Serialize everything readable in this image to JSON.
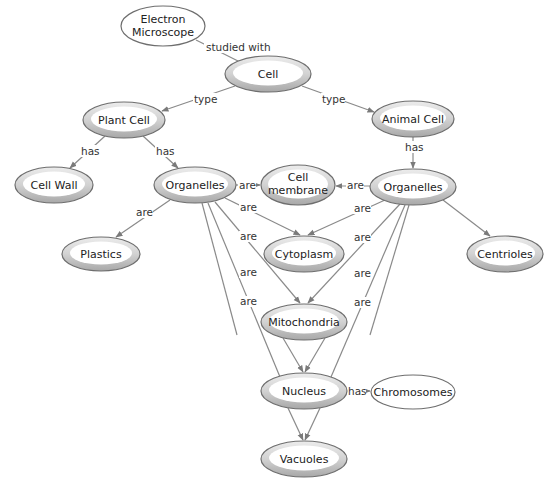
{
  "diagram": {
    "type": "concept-map",
    "nodes": [
      {
        "id": "electron_microscope",
        "label": [
          "Electron",
          "Microscope"
        ],
        "cx": 163,
        "cy": 26,
        "rx": 42,
        "ry": 20,
        "style": "plain"
      },
      {
        "id": "cell",
        "label": [
          "Cell"
        ],
        "cx": 268,
        "cy": 74,
        "rx": 43,
        "ry": 18,
        "style": "double"
      },
      {
        "id": "plant_cell",
        "label": [
          "Plant Cell"
        ],
        "cx": 124,
        "cy": 120,
        "rx": 41,
        "ry": 18,
        "style": "double"
      },
      {
        "id": "animal_cell",
        "label": [
          "Animal Cell"
        ],
        "cx": 413,
        "cy": 119,
        "rx": 41,
        "ry": 18,
        "style": "double"
      },
      {
        "id": "cell_wall",
        "label": [
          "Cell Wall"
        ],
        "cx": 54,
        "cy": 185,
        "rx": 39,
        "ry": 18,
        "style": "double"
      },
      {
        "id": "organelles_plant",
        "label": [
          "Organelles"
        ],
        "cx": 195,
        "cy": 185,
        "rx": 41,
        "ry": 18,
        "style": "double"
      },
      {
        "id": "cell_membrane",
        "label": [
          "Cell",
          "membrane"
        ],
        "cx": 298,
        "cy": 185,
        "rx": 37,
        "ry": 20,
        "style": "double"
      },
      {
        "id": "organelles_animal",
        "label": [
          "Organelles"
        ],
        "cx": 413,
        "cy": 187,
        "rx": 43,
        "ry": 18,
        "style": "double"
      },
      {
        "id": "plastics",
        "label": [
          "Plastics"
        ],
        "cx": 101,
        "cy": 254,
        "rx": 39,
        "ry": 17,
        "style": "double"
      },
      {
        "id": "cytoplasm",
        "label": [
          "Cytoplasm"
        ],
        "cx": 304,
        "cy": 254,
        "rx": 40,
        "ry": 18,
        "style": "double"
      },
      {
        "id": "centrioles",
        "label": [
          "Centrioles"
        ],
        "cx": 505,
        "cy": 254,
        "rx": 38,
        "ry": 18,
        "style": "double"
      },
      {
        "id": "mitochondria",
        "label": [
          "Mitochondria"
        ],
        "cx": 304,
        "cy": 322,
        "rx": 43,
        "ry": 18,
        "style": "double"
      },
      {
        "id": "nucleus",
        "label": [
          "Nucleus"
        ],
        "cx": 304,
        "cy": 391,
        "rx": 43,
        "ry": 18,
        "style": "double"
      },
      {
        "id": "chromosomes",
        "label": [
          "Chromosomes"
        ],
        "cx": 413,
        "cy": 392,
        "rx": 42,
        "ry": 17,
        "style": "plain"
      },
      {
        "id": "vacuoles",
        "label": [
          "Vacuoles"
        ],
        "cx": 304,
        "cy": 459,
        "rx": 43,
        "ry": 18,
        "style": "double"
      }
    ],
    "edges": [
      {
        "from": "electron_microscope",
        "to": "cell",
        "label": "studied with"
      },
      {
        "from": "cell",
        "to": "plant_cell",
        "label": "type"
      },
      {
        "from": "cell",
        "to": "animal_cell",
        "label": "type"
      },
      {
        "from": "plant_cell",
        "to": "cell_wall",
        "label": "has"
      },
      {
        "from": "plant_cell",
        "to": "organelles_plant",
        "label": "has"
      },
      {
        "from": "animal_cell",
        "to": "organelles_animal",
        "label": "has"
      },
      {
        "from": "organelles_plant",
        "to": "cell_membrane",
        "label": "are"
      },
      {
        "from": "organelles_animal",
        "to": "cell_membrane",
        "label": "are"
      },
      {
        "from": "organelles_plant",
        "to": "plastics",
        "label": "are"
      },
      {
        "from": "organelles_plant",
        "to": "cytoplasm",
        "label": "are"
      },
      {
        "from": "organelles_animal",
        "to": "cytoplasm",
        "label": "are"
      },
      {
        "from": "organelles_plant",
        "to": "mitochondria",
        "label": "are"
      },
      {
        "from": "organelles_animal",
        "to": "mitochondria",
        "label": "are"
      },
      {
        "from": "organelles_plant",
        "to": "nucleus",
        "label": "are"
      },
      {
        "from": "organelles_animal",
        "to": "nucleus",
        "label": "are"
      },
      {
        "from": "organelles_plant",
        "to": "vacuoles",
        "label": "are"
      },
      {
        "from": "organelles_animal",
        "to": "vacuoles",
        "label": "are"
      },
      {
        "from": "organelles_animal",
        "to": "centrioles",
        "label": ""
      },
      {
        "from": "nucleus",
        "to": "chromosomes",
        "label": "has"
      }
    ],
    "colors": {
      "line": "#8a8a8a",
      "oval_border": "#6e6e6e",
      "oval_ring_light": "#e6e6e6",
      "oval_ring_dark": "#b4b4b4",
      "text": "#222222"
    }
  }
}
